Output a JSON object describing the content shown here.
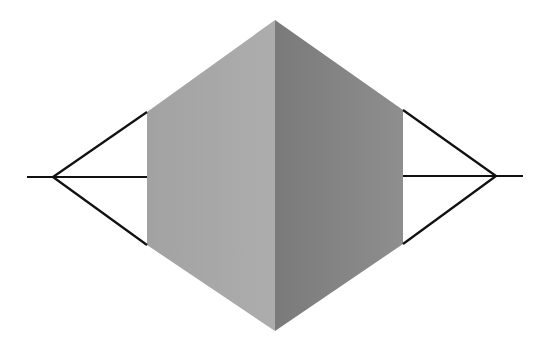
{
  "diagram": {
    "colors": {
      "background": "#ffffff",
      "left_face_light": "#adadad",
      "left_face_dark": "#a2a2a2",
      "right_face_light": "#8e8e8e",
      "right_face_dark": "#7a7a7a",
      "line": "#111111"
    },
    "cube": {
      "top_vertex": [
        275,
        20
      ],
      "bottom_vertex": [
        275,
        331
      ],
      "left_face": {
        "top_left": [
          147,
          112
        ],
        "bottom_left": [
          147,
          245
        ]
      },
      "right_face": {
        "top_right": [
          403,
          110
        ],
        "bottom_right": [
          403,
          244
        ]
      }
    },
    "left_vanishing_point": {
      "vertex": [
        53,
        177
      ],
      "horizon_start": [
        27,
        177
      ],
      "targets": [
        [
          147,
          112
        ],
        [
          147,
          177
        ],
        [
          147,
          245
        ]
      ]
    },
    "right_vanishing_point": {
      "vertex": [
        496,
        176
      ],
      "horizon_end": [
        523,
        176
      ],
      "targets": [
        [
          403,
          110
        ],
        [
          403,
          176
        ],
        [
          403,
          244
        ]
      ]
    }
  }
}
